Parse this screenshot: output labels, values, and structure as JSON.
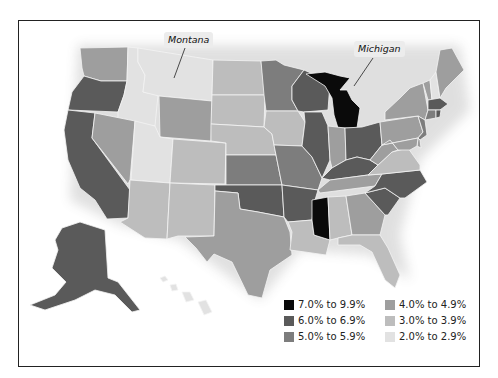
{
  "callouts": {
    "montana": "Montana",
    "michigan": "Michigan"
  },
  "legend": [
    {
      "label": "7.0% to 9.9%",
      "color": "#0a0a0a",
      "key": "c7"
    },
    {
      "label": "6.0% to 6.9%",
      "color": "#5a5a5a",
      "key": "c6"
    },
    {
      "label": "5.0% to 5.9%",
      "color": "#7d7d7d",
      "key": "c5"
    },
    {
      "label": "4.0% to 4.9%",
      "color": "#9e9e9e",
      "key": "c4"
    },
    {
      "label": "3.0% to 3.9%",
      "color": "#bdbdbd",
      "key": "c3"
    },
    {
      "label": "2.0% to 2.9%",
      "color": "#e2e2e2",
      "key": "c2"
    }
  ],
  "states": {
    "WA": "c4",
    "OR": "c6",
    "CA": "c6",
    "ID": "c2",
    "NV": "c4",
    "MT": "c2",
    "WY": "c4",
    "UT": "c2",
    "AZ": "c3",
    "CO": "c3",
    "NM": "c3",
    "ND": "c3",
    "SD": "c3",
    "NE": "c3",
    "KS": "c5",
    "OK": "c6",
    "TX": "c4",
    "MN": "c5",
    "IA": "c3",
    "MO": "c5",
    "AR": "c6",
    "LA": "c3",
    "WI": "c6",
    "IL": "c6",
    "MI": "c7",
    "IN": "c4",
    "OH": "c6",
    "KY": "c6",
    "TN": "c4",
    "MS": "c7",
    "AL": "c3",
    "GA": "c4",
    "FL": "c3",
    "SC": "c6",
    "NC": "c6",
    "VA": "c3",
    "WV": "c4",
    "PA": "c4",
    "NY": "c4",
    "VT": "c4",
    "NH": "c2",
    "ME": "c4",
    "MA": "c6",
    "CT": "c5",
    "RI": "c6",
    "NJ": "c5",
    "DE": "c4",
    "MD": "c4",
    "AK": "c6",
    "HI": "c2"
  }
}
